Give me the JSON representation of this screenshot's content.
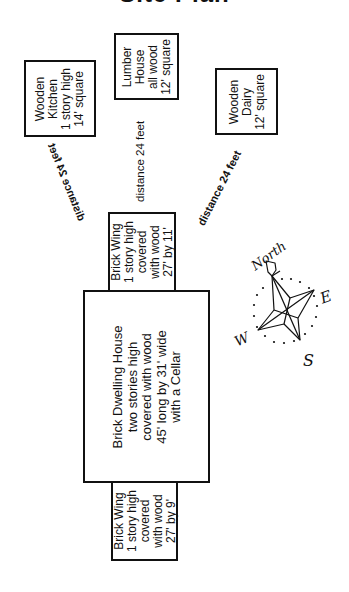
{
  "title": "Site Plan",
  "buildings": {
    "kitchen": {
      "lines": [
        "Wooden",
        "Kitchen",
        "1 story high",
        "14' square"
      ]
    },
    "lumber_house": {
      "lines": [
        "Lumber",
        "House",
        "all wood",
        "12' square"
      ]
    },
    "dairy": {
      "lines": [
        "Wooden",
        "Dairy",
        "12' square"
      ]
    },
    "north_wing": {
      "lines": [
        "Brick Wing",
        "1 story high",
        "covered",
        "with wood",
        "27' by 11'"
      ]
    },
    "dwelling_house": {
      "lines": [
        "Brick Dwelling House",
        "two stories high",
        "covered with wood",
        "45' long by 31' wide",
        "with a Cellar"
      ]
    },
    "south_wing": {
      "lines": [
        "Brick Wing",
        "1 story high",
        "covered",
        "with wood",
        "27' by 9'"
      ]
    }
  },
  "distances": {
    "to_kitchen": "distance 24 feet",
    "to_lumber_house": "distance 24 feet",
    "to_dairy": "distance 24 feet"
  },
  "compass": {
    "north": "North",
    "east": "E",
    "south": "S",
    "west": "W"
  }
}
